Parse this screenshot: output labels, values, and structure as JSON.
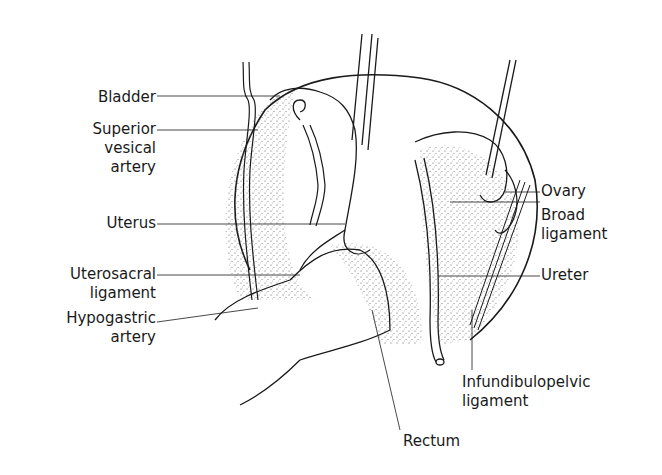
{
  "diagram": {
    "type": "anatomical-illustration",
    "labels_left": [
      {
        "id": "bladder",
        "lines": [
          "Bladder"
        ]
      },
      {
        "id": "superior-vesical-artery",
        "lines": [
          "Superior",
          "vesical",
          "artery"
        ]
      },
      {
        "id": "uterus",
        "lines": [
          "Uterus"
        ]
      },
      {
        "id": "uterosacral-ligament",
        "lines": [
          "Uterosacral",
          "ligament"
        ]
      },
      {
        "id": "hypogastric-artery",
        "lines": [
          "Hypogastric",
          "artery"
        ]
      }
    ],
    "labels_right": [
      {
        "id": "ovary",
        "lines": [
          "Ovary"
        ]
      },
      {
        "id": "broad-ligament",
        "lines": [
          "Broad",
          "ligament"
        ]
      },
      {
        "id": "ureter",
        "lines": [
          "Ureter"
        ]
      },
      {
        "id": "infundibulopelvic-ligament",
        "lines": [
          "Infundibulopelvic",
          "ligament"
        ]
      }
    ],
    "labels_bottom": [
      {
        "id": "rectum",
        "lines": [
          "Rectum"
        ]
      }
    ],
    "colors": {
      "ink": "#1a1a1a",
      "background": "#ffffff",
      "stipple": "#555555"
    }
  }
}
